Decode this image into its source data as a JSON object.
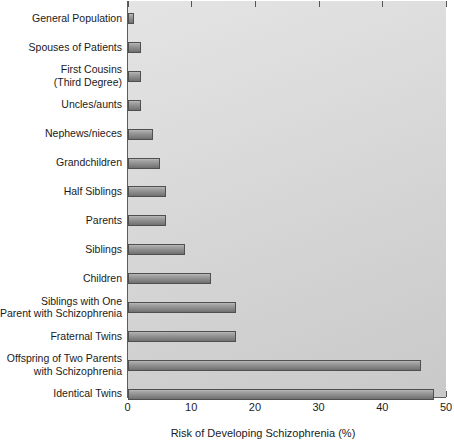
{
  "chart_data": {
    "type": "bar",
    "orientation": "horizontal",
    "title": "",
    "xlabel": "Risk of Developing Schizophrenia (%)",
    "ylabel": "",
    "xlim": [
      0,
      50
    ],
    "xticks": [
      0,
      10,
      20,
      30,
      40,
      50
    ],
    "xtick_labels": [
      "0",
      "10",
      "20",
      "30",
      "40",
      "50"
    ],
    "grid": false,
    "legend": false,
    "categories": [
      "General Population",
      "Spouses of Patients",
      "First Cousins\n(Third Degree)",
      "Uncles/aunts",
      "Nephews/nieces",
      "Grandchildren",
      "Half Siblings",
      "Parents",
      "Siblings",
      "Children",
      "Siblings with One\nParent with Schizophrenia",
      "Fraternal Twins",
      "Offspring of Two Parents\nwith Schizophrenia",
      "Identical Twins"
    ],
    "values": [
      1,
      2,
      2,
      2,
      4,
      5,
      6,
      6,
      9,
      13,
      17,
      17,
      46,
      48
    ],
    "bar_color": "#8e8e8e",
    "bar_border_color": "#4f4f4f",
    "background_color": "#dcdcdc"
  },
  "axis": {
    "x_title": "Risk of Developing Schizophrenia (%)"
  }
}
